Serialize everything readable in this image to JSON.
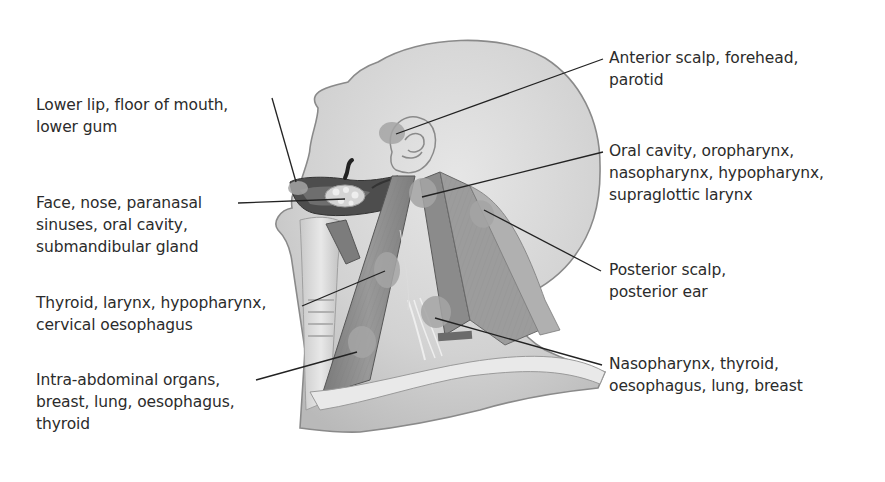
{
  "figure": {
    "colors": {
      "skin": "#cfcfcf",
      "skin_outline": "#8a8a8a",
      "node_region": "#a9a9a9",
      "muscle": "#8f8f8f",
      "muscle_dark": "#5e5e5e",
      "leader_line": "#222222",
      "text": "#2b2b2b"
    }
  },
  "labels_left": [
    {
      "id": "lower-lip",
      "lines": [
        "Lower lip, floor of mouth,",
        "lower gum"
      ]
    },
    {
      "id": "face-nose",
      "lines": [
        "Face, nose, paranasal",
        "sinuses, oral cavity,",
        "submandibular gland"
      ]
    },
    {
      "id": "thyroid-larynx",
      "lines": [
        "Thyroid, larynx, hypopharynx,",
        "cervical oesophagus"
      ]
    },
    {
      "id": "intra-abdominal",
      "lines": [
        "Intra-abdominal organs,",
        "breast, lung, oesophagus,",
        "thyroid"
      ]
    }
  ],
  "labels_right": [
    {
      "id": "anterior-scalp",
      "lines": [
        "Anterior scalp, forehead,",
        "parotid"
      ]
    },
    {
      "id": "oral-cavity",
      "lines": [
        "Oral cavity, oropharynx,",
        "nasopharynx, hypopharynx,",
        "supraglottic larynx"
      ]
    },
    {
      "id": "posterior-scalp",
      "lines": [
        "Posterior scalp,",
        "posterior ear"
      ]
    },
    {
      "id": "nasopharynx",
      "lines": [
        "Nasopharynx, thyroid,",
        "oesophagus, lung, breast"
      ]
    }
  ]
}
